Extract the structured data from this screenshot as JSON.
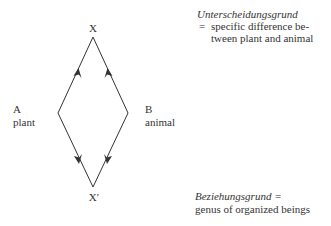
{
  "diagram": {
    "nodes": {
      "top": {
        "label": "X"
      },
      "bottom": {
        "label": "X′"
      },
      "left": {
        "letter": "A",
        "label": "plant"
      },
      "right": {
        "letter": "B",
        "label": "animal"
      }
    },
    "edges": [
      {
        "from": "left",
        "to": "top",
        "arrow": "up"
      },
      {
        "from": "right",
        "to": "top",
        "arrow": "up"
      },
      {
        "from": "left",
        "to": "bottom",
        "arrow": "down"
      },
      {
        "from": "right",
        "to": "bottom",
        "arrow": "down"
      }
    ],
    "line_color": "#333333"
  },
  "annotations": {
    "unterscheidungsgrund": {
      "term": "Unterscheidungsgrund",
      "eq": "=",
      "line1": "specific difference be-",
      "line2": "tween plant and animal"
    },
    "beziehungsgrund": {
      "term": "Beziehungsgrund",
      "eq": "=",
      "line1": "genus of organized beings"
    }
  }
}
